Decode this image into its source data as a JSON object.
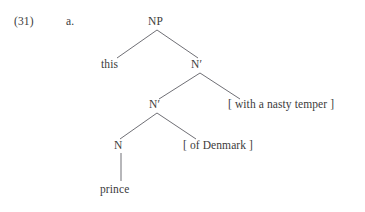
{
  "example": {
    "number": "(31)",
    "letter": "a."
  },
  "tree": {
    "type": "x-bar-syntax-tree",
    "root_label": "NP",
    "nodes": [
      {
        "id": "np",
        "label": "NP",
        "kind": "phrase",
        "x": 157,
        "y": 22
      },
      {
        "id": "this",
        "label": "this",
        "kind": "terminal",
        "x": 115,
        "y": 65
      },
      {
        "id": "nbar1",
        "label": "N′",
        "kind": "bar",
        "x": 200,
        "y": 65
      },
      {
        "id": "nbar2",
        "label": "N′",
        "kind": "bar",
        "x": 157,
        "y": 105
      },
      {
        "id": "pp1",
        "label": "[ with a nasty temper ]",
        "kind": "adjunct",
        "x": 229,
        "y": 105
      },
      {
        "id": "n",
        "label": "N",
        "kind": "head",
        "x": 118,
        "y": 146
      },
      {
        "id": "pp2",
        "label": "[ of Denmark ]",
        "kind": "adjunct",
        "x": 184,
        "y": 146
      },
      {
        "id": "prince",
        "label": "prince",
        "kind": "terminal",
        "x": 100,
        "y": 190
      }
    ],
    "edges": [
      {
        "from": "np",
        "to": "this",
        "x1": 157,
        "y1": 30,
        "x2": 117,
        "y2": 58
      },
      {
        "from": "np",
        "to": "nbar1",
        "x1": 157,
        "y1": 30,
        "x2": 198,
        "y2": 58
      },
      {
        "from": "nbar1",
        "to": "nbar2",
        "x1": 200,
        "y1": 73,
        "x2": 159,
        "y2": 99
      },
      {
        "from": "nbar1",
        "to": "pp1",
        "x1": 200,
        "y1": 73,
        "x2": 240,
        "y2": 99
      },
      {
        "from": "nbar2",
        "to": "n",
        "x1": 157,
        "y1": 113,
        "x2": 120,
        "y2": 139
      },
      {
        "from": "nbar2",
        "to": "pp2",
        "x1": 157,
        "y1": 113,
        "x2": 196,
        "y2": 139
      },
      {
        "from": "n",
        "to": "prince",
        "x1": 121,
        "y1": 153,
        "x2": 121,
        "y2": 181
      }
    ]
  },
  "colors": {
    "background": "#ffffff",
    "text": "#3b3b3b",
    "line": "#55555c"
  }
}
